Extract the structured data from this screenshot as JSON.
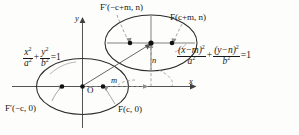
{
  "figure": {
    "kind": "ellipse-translation-diagram",
    "background_color": "#fdfdfb",
    "ink_color": "#171717",
    "axes": {
      "x_label": "x",
      "y_label": "y",
      "origin_label": "O"
    },
    "shift_labels": {
      "horizontal": "m",
      "vertical": "n"
    },
    "equations": {
      "standard": {
        "num_x": "x",
        "den_x": "a",
        "num_y": "y",
        "den_y": "b",
        "rhs": "1",
        "plus": "+",
        "equals": "="
      },
      "translated": {
        "num_x": "(x−m)",
        "den_x": "a",
        "num_y": "(y−n)",
        "den_y": "b",
        "rhs": "1",
        "plus": "+",
        "equals": "="
      },
      "exponent": "2"
    },
    "foci": {
      "lower_left": "F′(−c, 0)",
      "lower_right": "F(c, 0)",
      "upper_left": "F′(−c+m, n)",
      "upper_right": "F(c+m, n)"
    }
  }
}
